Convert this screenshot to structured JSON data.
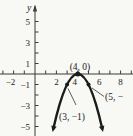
{
  "figure": {
    "y_axis_label": "y",
    "point_labels": {
      "vertex": "(4, 0)",
      "left": "(3, −1)",
      "right": "(5, −"
    }
  },
  "chart_data": {
    "type": "line",
    "title": "",
    "xlabel": "",
    "ylabel": "y",
    "grid": false,
    "curve": {
      "shape": "downward-parabola",
      "vertex": [
        4,
        0
      ],
      "leading_coefficient": -1,
      "x_draw_range": [
        1.72,
        6.28
      ]
    },
    "points": [
      {
        "x": 4,
        "y": 0,
        "label": "(4, 0)"
      },
      {
        "x": 3,
        "y": -1,
        "label": "(3, −1)"
      },
      {
        "x": 5,
        "y": -1,
        "label": "(5, −"
      }
    ],
    "x_tick_labels": [
      {
        "v": -2,
        "t": "−2"
      },
      {
        "v": 2,
        "t": "2"
      },
      {
        "v": 4,
        "t": "4"
      },
      {
        "v": 6,
        "t": "6"
      },
      {
        "v": 8,
        "t": "8"
      }
    ],
    "y_tick_labels": [
      {
        "v": 5,
        "t": "5"
      },
      {
        "v": 3,
        "t": "3"
      },
      {
        "v": 1,
        "t": "1"
      },
      {
        "v": -1,
        "t": "−1"
      },
      {
        "v": -3,
        "t": "−3"
      },
      {
        "v": -5,
        "t": "−5"
      }
    ],
    "x_tick_range": [
      -3,
      9
    ],
    "y_tick_range": [
      -5,
      5
    ],
    "xlim": [
      -3.3,
      9.2
    ],
    "ylim": [
      -5.9,
      7.0
    ],
    "colors": {
      "curve": "#1b1b1b",
      "axis": "#3b3b3b",
      "text": "#222222",
      "background": "#f8f8f5"
    }
  }
}
